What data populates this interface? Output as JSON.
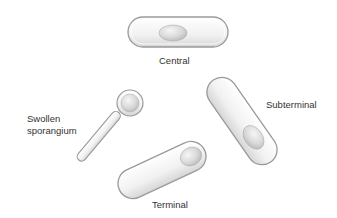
{
  "diagram": {
    "type": "bacterial endospore positions",
    "items": [
      {
        "id": "central",
        "label": "Central"
      },
      {
        "id": "subterminal",
        "label": "Subterminal"
      },
      {
        "id": "terminal",
        "label": "Terminal"
      },
      {
        "id": "swollen",
        "label_line1": "Swollen",
        "label_line2": "sporangium"
      }
    ]
  },
  "colors": {
    "cell_fill": "#f2f2f2",
    "cell_outline": "#9a9a9a",
    "spore_fill": "#d8d8d8",
    "text": "#333333"
  }
}
